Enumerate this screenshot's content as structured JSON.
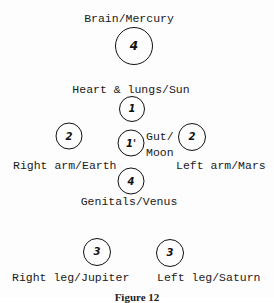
{
  "diagram": {
    "colors": {
      "ink": "#111111",
      "background": "#ffffff"
    },
    "nodes": [
      {
        "id": "brain",
        "number": "4",
        "label": "Brain/Mercury"
      },
      {
        "id": "heart",
        "number": "1",
        "label": "Heart & lungs/Sun"
      },
      {
        "id": "right_arm",
        "number": "2",
        "label": "Right arm/Earth"
      },
      {
        "id": "gut",
        "number": "1'",
        "label_line1": "Gut/",
        "label_line2": "Moon"
      },
      {
        "id": "left_arm",
        "number": "2",
        "label": "Left arm/Mars"
      },
      {
        "id": "genitals",
        "number": "4",
        "label": "Genitals/Venus"
      },
      {
        "id": "right_leg",
        "number": "3",
        "label": "Right leg/Jupiter"
      },
      {
        "id": "left_leg",
        "number": "3",
        "label": "Left leg/Saturn"
      }
    ],
    "caption": "Figure 12"
  }
}
